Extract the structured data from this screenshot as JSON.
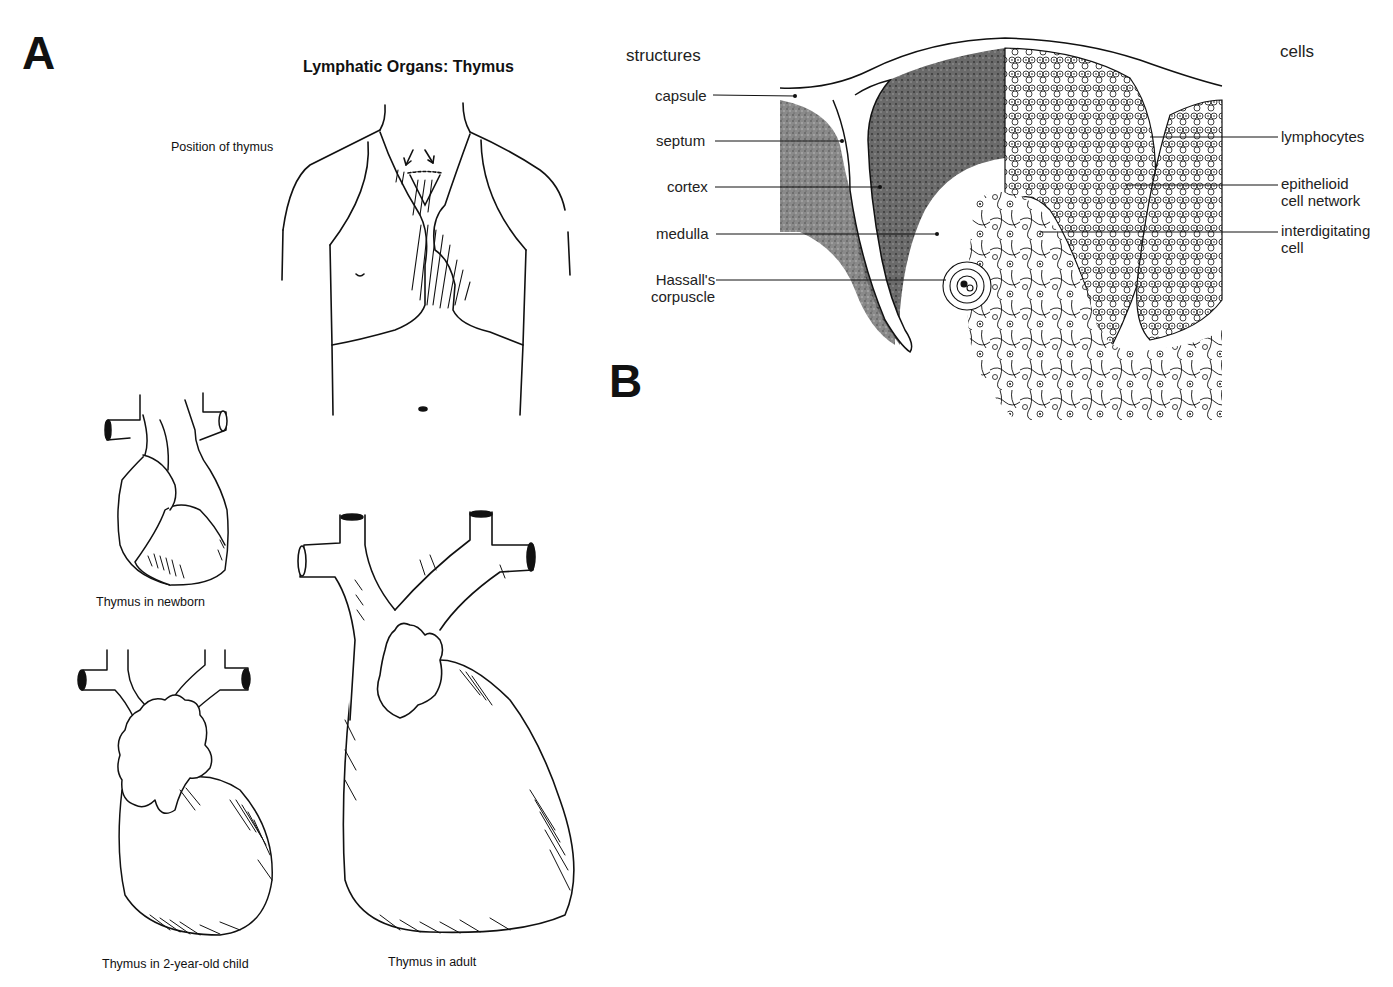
{
  "panel_a": {
    "letter": "A",
    "title": "Lymphatic Organs: Thymus",
    "position_label": "Position of thymus",
    "captions": {
      "newborn": "Thymus in newborn",
      "child": "Thymus in 2-year-old child",
      "adult": "Thymus in adult"
    }
  },
  "panel_b": {
    "letter": "B",
    "left_heading": "structures",
    "right_heading": "cells",
    "structures": [
      {
        "label": "capsule"
      },
      {
        "label": "septum"
      },
      {
        "label": "cortex"
      },
      {
        "label": "medulla"
      },
      {
        "label": "Hassall's\ncorpuscle",
        "line1": "Hassall's",
        "line2": "corpuscle"
      }
    ],
    "cells": [
      {
        "label": "lymphocytes"
      },
      {
        "label": "epithelioid cell network",
        "line1": "epithelioid",
        "line2": "cell network"
      },
      {
        "label": "interdigitating cell",
        "line1": "interdigitating",
        "line2": "cell"
      }
    ]
  },
  "colors": {
    "ink": "#111111",
    "tissue_shade": "#7a7a7a",
    "tissue_dark": "#555555",
    "background": "#ffffff"
  }
}
